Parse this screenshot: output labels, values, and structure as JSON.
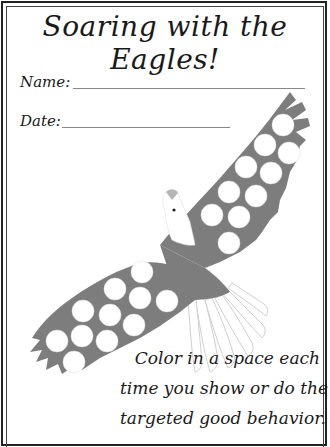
{
  "worksheet": {
    "title": "Soaring with the Eagles!",
    "fields": [
      {
        "label": "Name:",
        "value": ""
      },
      {
        "label": "Date:",
        "value": ""
      }
    ],
    "instructions": [
      "Color in a space each",
      "time you show or do the",
      "targeted good behavior."
    ],
    "chart": {
      "total_spaces": 21,
      "filled_spaces": 0,
      "wing_color": "#7a7a7a",
      "space_color": "#ffffff"
    }
  }
}
